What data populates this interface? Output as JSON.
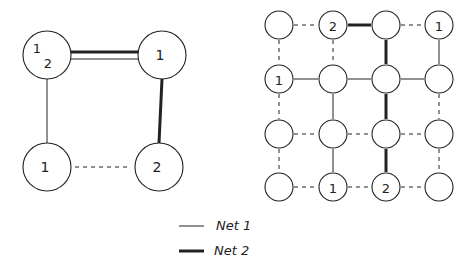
{
  "colors": {
    "ink": "#222222",
    "background": "#ffffff"
  },
  "line_styles": {
    "net1": "thin-solid",
    "net2": "thick-solid",
    "unused": "dashed"
  },
  "left_graph": {
    "nodes": [
      {
        "id": "TL",
        "labels": [
          "1",
          "2"
        ]
      },
      {
        "id": "TR",
        "labels": [
          "1"
        ]
      },
      {
        "id": "BL",
        "labels": [
          "1"
        ]
      },
      {
        "id": "BR",
        "labels": [
          "2"
        ]
      }
    ],
    "edges": [
      {
        "from": "TL",
        "to": "TR",
        "nets": [
          "net1",
          "net2"
        ]
      },
      {
        "from": "TL",
        "to": "BL",
        "nets": [
          "net1"
        ]
      },
      {
        "from": "TR",
        "to": "BR",
        "nets": [
          "net2"
        ]
      },
      {
        "from": "BL",
        "to": "BR",
        "nets": [
          "unused"
        ]
      }
    ]
  },
  "right_grid": {
    "rows": 4,
    "cols": 4,
    "node_labels": [
      [
        "",
        "2",
        "",
        "1"
      ],
      [
        "1",
        "",
        "",
        ""
      ],
      [
        "",
        "",
        "",
        ""
      ],
      [
        "",
        "1",
        "2",
        ""
      ]
    ],
    "horizontal_edges": [
      [
        "unused",
        "net2",
        "unused"
      ],
      [
        "net1",
        "net1",
        "net1"
      ],
      [
        "unused",
        "unused",
        "unused"
      ],
      [
        "unused",
        "unused",
        "unused"
      ]
    ],
    "vertical_edges": [
      [
        "unused",
        "unused",
        "net2",
        "net1"
      ],
      [
        "unused",
        "net1",
        "net2",
        "unused"
      ],
      [
        "unused",
        "net1",
        "net2",
        "unused"
      ]
    ]
  },
  "legend": [
    {
      "net": "net1",
      "label": "Net 1"
    },
    {
      "net": "net2",
      "label": "Net 2"
    }
  ]
}
